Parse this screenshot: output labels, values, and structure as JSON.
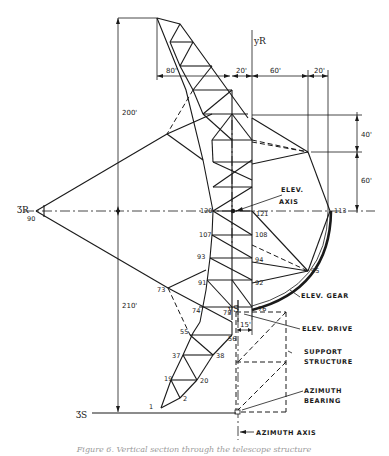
{
  "diagram": {
    "caption": "Figure 6. Vertical section through the telescope structure",
    "axes": {
      "z_r": "ƷR",
      "z_r_node": "90",
      "y_r": "yR",
      "y_s": "yS",
      "z_s": "ƷS"
    },
    "dimensions": {
      "upper_height": "200'",
      "lower_height": "210'",
      "width_80": "80'",
      "width_20_left": "20'",
      "width_60": "60'",
      "width_20_right": "20'",
      "height_40": "40'",
      "height_60": "60'",
      "offset_15": "15'"
    },
    "node_labels": {
      "n1": "1",
      "n2": "2",
      "n19": "19",
      "n20": "20",
      "n37": "37",
      "n38": "38",
      "n55": "55",
      "n56": "56",
      "n73": "73",
      "n74": "74",
      "n75": "75",
      "n76": "76",
      "n91": "91",
      "n92": "92",
      "n93": "93",
      "n94": "94",
      "n95": "95",
      "n107": "107",
      "n108": "108",
      "n113": "113",
      "n120": "120",
      "n121": "121"
    },
    "annotations": {
      "elev_axis_1": "ELEV.",
      "elev_axis_2": "AXIS",
      "elev_gear": "ELEV. GEAR",
      "elev_drive": "ELEV. DRIVE",
      "support_1": "SUPPORT",
      "support_2": "STRUCTURE",
      "azimuth_bearing_1": "AZIMUTH",
      "azimuth_bearing_2": "BEARING",
      "azimuth_axis": "AZIMUTH AXIS"
    }
  }
}
